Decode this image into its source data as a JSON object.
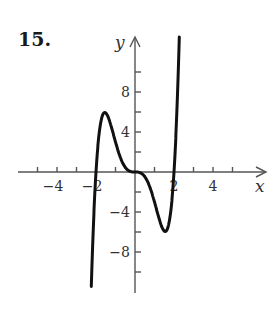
{
  "problem": {
    "number": "15."
  },
  "chart_data": {
    "type": "line",
    "title": "",
    "xlabel": "x",
    "ylabel": "y",
    "x_ticks": [
      -5,
      -4,
      -3,
      -2,
      -1,
      1,
      2,
      3,
      4,
      5
    ],
    "x_tick_labels": [
      {
        "value": -4,
        "label": "−4"
      },
      {
        "value": -2,
        "label": "−2"
      },
      {
        "value": 2,
        "label": "2"
      },
      {
        "value": 4,
        "label": "4"
      }
    ],
    "y_ticks": [
      -10,
      -8,
      -6,
      -4,
      -2,
      2,
      4,
      6,
      8,
      10
    ],
    "y_tick_labels": [
      {
        "value": 8,
        "label": "8"
      },
      {
        "value": 4,
        "label": "4"
      },
      {
        "value": -4,
        "label": "−4"
      },
      {
        "value": -8,
        "label": "−8"
      }
    ],
    "xlim": [
      -6,
      6.5
    ],
    "ylim": [
      -12,
      13.5
    ],
    "grid": false,
    "legend": null,
    "series": [
      {
        "name": "f(x)",
        "x": [
          -2.35,
          -2.2,
          -2.0,
          -1.8,
          -1.6,
          -1.5,
          -1.4,
          -1.2,
          -1.0,
          -0.8,
          -0.5,
          0.0,
          0.5,
          0.8,
          1.0,
          1.2,
          1.4,
          1.5,
          1.6,
          1.8,
          2.0,
          2.2,
          2.35
        ],
        "values": [
          -12.0,
          -7.8,
          0.0,
          4.5,
          5.8,
          5.9,
          5.8,
          4.0,
          3.0,
          2.1,
          0.9,
          0.0,
          -0.9,
          -2.1,
          -3.0,
          -4.0,
          -5.8,
          -5.9,
          -5.8,
          -4.5,
          0.0,
          7.8,
          13.5
        ]
      }
    ],
    "features": {
      "roots": [
        -2,
        0,
        2
      ],
      "local_max": {
        "x": -1.5,
        "y": 5.9
      },
      "local_min": {
        "x": 1.5,
        "y": -5.9
      },
      "inflection_at_origin": true
    }
  }
}
